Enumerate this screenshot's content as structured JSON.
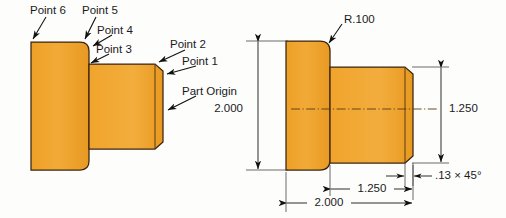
{
  "figure": {
    "colors": {
      "part_fill": "#efa12a",
      "part_fill_light": "#f2ad3f",
      "part_outline": "#3a2410",
      "text": "#1b1b1b",
      "background": "#fdfdfb"
    }
  },
  "left_view": {
    "name": "point-callout-view",
    "callouts": [
      {
        "id": "point6",
        "label": "Point 6"
      },
      {
        "id": "point5",
        "label": "Point 5"
      },
      {
        "id": "point4",
        "label": "Point 4"
      },
      {
        "id": "point3",
        "label": "Point 3"
      },
      {
        "id": "point2",
        "label": "Point 2"
      },
      {
        "id": "point1",
        "label": "Point 1"
      },
      {
        "id": "partorigin",
        "label": "Part Origin"
      }
    ]
  },
  "right_view": {
    "name": "dimensioned-view",
    "notes": [
      {
        "id": "radius",
        "label": "R.100"
      },
      {
        "id": "chamfer",
        "label": ".13 × 45°"
      }
    ],
    "dimensions": [
      {
        "id": "dia-major",
        "label": "2.000",
        "orientation": "vertical",
        "side": "left"
      },
      {
        "id": "dia-minor",
        "label": "1.250",
        "orientation": "vertical",
        "side": "right"
      },
      {
        "id": "len-minor",
        "label": "1.250",
        "orientation": "horizontal",
        "side": "bottom"
      },
      {
        "id": "len-overall",
        "label": "2.000",
        "orientation": "horizontal",
        "side": "bottom"
      }
    ]
  }
}
